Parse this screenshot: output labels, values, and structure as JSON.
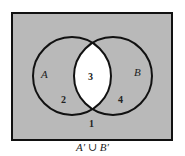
{
  "diagram": {
    "type": "venn",
    "sets": [
      {
        "label": "A"
      },
      {
        "label": "B"
      }
    ],
    "regions": [
      {
        "number": "1",
        "description": "outside both"
      },
      {
        "number": "2",
        "description": "A only"
      },
      {
        "number": "3",
        "description": "A and B"
      },
      {
        "number": "4",
        "description": "B only"
      }
    ],
    "caption": "A′ ∪ B′",
    "colors": {
      "shaded": "#b9b9b9",
      "unshaded": "#ffffff",
      "stroke": "#111111"
    }
  }
}
